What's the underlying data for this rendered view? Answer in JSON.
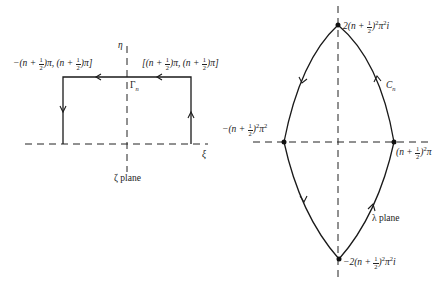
{
  "zeta_plane": {
    "plane_label": "ζ plane",
    "axis_h_label": "ξ",
    "axis_v_label": "η",
    "contour_label": "Γ",
    "contour_sub": "n",
    "corner_left": {
      "prefix": "−(n + ",
      "frac_num": "1",
      "frac_den": "2",
      "mid": ")π, (n + ",
      "frac2_num": "1",
      "frac2_den": "2",
      "suffix": ")π]"
    },
    "corner_right": {
      "prefix": "[(n + ",
      "frac_num": "1",
      "frac_den": "2",
      "mid": ")π, (n + ",
      "frac2_num": "1",
      "frac2_den": "2",
      "suffix": ")π]"
    }
  },
  "lambda_plane": {
    "plane_label": "λ plane",
    "contour_label": "C",
    "contour_sub": "n",
    "top_point": {
      "prefix": "2(n + ",
      "frac_num": "1",
      "frac_den": "2",
      "mid": ")",
      "exp1": "2",
      "mid2": "π",
      "exp2": "2",
      "suffix": "i"
    },
    "bottom_point": {
      "prefix": "−2(n + ",
      "frac_num": "1",
      "frac_den": "2",
      "mid": ")",
      "exp1": "2",
      "mid2": "π",
      "exp2": "2",
      "suffix": "i"
    },
    "left_point": {
      "prefix": "−(n + ",
      "frac_num": "1",
      "frac_den": "2",
      "mid": ")",
      "exp1": "2",
      "mid2": "π",
      "exp2": "2"
    },
    "right_point": {
      "prefix": "(n + ",
      "frac_num": "1",
      "frac_den": "2",
      "mid": ")",
      "exp1": "2",
      "suffix": "π"
    }
  },
  "colors": {
    "line": "#1a1a1a",
    "background": "#ffffff"
  }
}
